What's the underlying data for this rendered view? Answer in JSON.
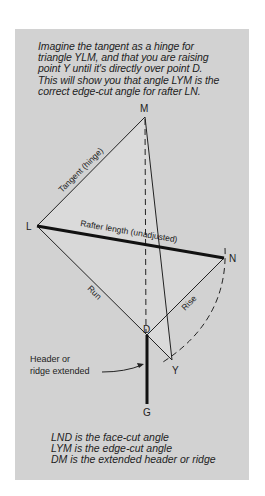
{
  "caption": {
    "lines": [
      "Imagine the tangent as a hinge for",
      "triangle YLM, and that you are raising",
      "point Y until it's directly over point D.",
      "This will show you that angle LYM is the",
      "correct edge-cut angle for rafter LN."
    ]
  },
  "diagram": {
    "points": {
      "M": "M",
      "L": "L",
      "N": "N",
      "D": "D",
      "Y": "Y",
      "G": "G"
    },
    "line_labels": {
      "tangent": "Tangent (hinge)",
      "rafter": "Rafter length (unadjusted)",
      "run": "Run",
      "rise": "Rise"
    },
    "callout": {
      "line1": "Header or",
      "line2": "ridge extended"
    }
  },
  "legend": {
    "lines": [
      "LND is the face-cut angle",
      "LYM is the edge-cut angle",
      "DM is the extended header or ridge"
    ]
  },
  "colors": {
    "panel": "#d2d2d2",
    "triangle_fill": "#dcdcdc",
    "ink": "#222222"
  }
}
